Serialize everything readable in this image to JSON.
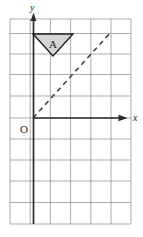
{
  "figure": {
    "background_color": "#ffffff",
    "grid": {
      "line_color": "#8a8a8a",
      "columns": 6,
      "rows": 10,
      "cell_width": 20.2,
      "cell_height": 20.5,
      "left": 10,
      "top": 19,
      "right": 131,
      "bottom": 224
    },
    "axes": {
      "color": "#2b2b2b",
      "x_axis": {
        "label": "x",
        "y_pixel": 118,
        "start_x": 33,
        "end_x": 133,
        "arrow": "right"
      },
      "y_axis": {
        "label": "y",
        "x_pixel": 33,
        "start_y": 224,
        "end_y": 13,
        "arrow": "up"
      },
      "origin_label": "O"
    },
    "dashed_line": {
      "label": "mirror-line",
      "color": "#3a3a3a",
      "dash_pattern": "5 4",
      "from_x": 33,
      "from_y": 118,
      "to_x": 111,
      "to_y": 32,
      "angle_degrees": 45
    },
    "shapes": [
      {
        "name": "triangle-A",
        "label": "A",
        "orientation": "down",
        "fill_color": "#d4d4d4",
        "stroke_color": "#1e1e1e",
        "vertices": [
          {
            "x": 33,
            "y": 34
          },
          {
            "x": 73,
            "y": 34
          },
          {
            "x": 53,
            "y": 56
          }
        ],
        "label_x": 53,
        "label_y": 45
      }
    ]
  }
}
